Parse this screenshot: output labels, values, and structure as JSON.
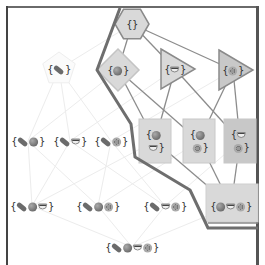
{
  "diagram": {
    "type": "hasse-lattice",
    "elements": {
      "hotdog": "🌭",
      "tomato": "🍅",
      "cup": "☕",
      "cookie": "🍪"
    },
    "nodes": [
      {
        "id": "empty",
        "label": "{}",
        "items": [],
        "shape": "hexagon",
        "highlighted": true,
        "x": 132,
        "y": 24
      },
      {
        "id": "h",
        "label": "{🌭}",
        "items": [
          "hotdog"
        ],
        "shape": "pentagon",
        "highlighted": false,
        "x": 59,
        "y": 69
      },
      {
        "id": "t",
        "label": "{🍅}",
        "items": [
          "tomato"
        ],
        "shape": "diamond",
        "highlighted": true,
        "x": 118,
        "y": 70
      },
      {
        "id": "c",
        "label": "{☕}",
        "items": [
          "cup"
        ],
        "shape": "triangle",
        "highlighted": true,
        "x": 175,
        "y": 69
      },
      {
        "id": "k",
        "label": "{🍪}",
        "items": [
          "cookie"
        ],
        "shape": "triangle",
        "highlighted": true,
        "x": 233,
        "y": 70
      },
      {
        "id": "ht",
        "label": "{🌭🍅}",
        "items": [
          "hotdog",
          "tomato"
        ],
        "shape": "none",
        "highlighted": false,
        "x": 28,
        "y": 141
      },
      {
        "id": "hc",
        "label": "{🌭☕}",
        "items": [
          "hotdog",
          "cup"
        ],
        "shape": "none",
        "highlighted": false,
        "x": 70,
        "y": 141
      },
      {
        "id": "hk",
        "label": "{🌭🍪}",
        "items": [
          "hotdog",
          "cookie"
        ],
        "shape": "none",
        "highlighted": false,
        "x": 111,
        "y": 141
      },
      {
        "id": "tc",
        "label": "{🍅☕}",
        "items": [
          "tomato",
          "cup"
        ],
        "shape": "square",
        "highlighted": true,
        "x": 155,
        "y": 141
      },
      {
        "id": "tk",
        "label": "{🍅🍪}",
        "items": [
          "tomato",
          "cookie"
        ],
        "shape": "square",
        "highlighted": true,
        "x": 199,
        "y": 141
      },
      {
        "id": "ck",
        "label": "{☕🍪}",
        "items": [
          "cup",
          "cookie"
        ],
        "shape": "square",
        "highlighted": true,
        "x": 240,
        "y": 141
      },
      {
        "id": "htc",
        "label": "{🌭🍅☕}",
        "items": [
          "hotdog",
          "tomato",
          "cup"
        ],
        "shape": "none",
        "highlighted": false,
        "x": 32,
        "y": 206
      },
      {
        "id": "htk",
        "label": "{🌭🍅🍪}",
        "items": [
          "hotdog",
          "tomato",
          "cookie"
        ],
        "shape": "none",
        "highlighted": false,
        "x": 98,
        "y": 206
      },
      {
        "id": "hck",
        "label": "{🌭☕🍪}",
        "items": [
          "hotdog",
          "cup",
          "cookie"
        ],
        "shape": "none",
        "highlighted": false,
        "x": 165,
        "y": 206
      },
      {
        "id": "tck",
        "label": "{🍅☕🍪}",
        "items": [
          "tomato",
          "cup",
          "cookie"
        ],
        "shape": "rectangle",
        "highlighted": true,
        "x": 231,
        "y": 206
      },
      {
        "id": "htck",
        "label": "{🌭🍅☕🍪}",
        "items": [
          "hotdog",
          "tomato",
          "cup",
          "cookie"
        ],
        "shape": "none",
        "highlighted": false,
        "x": 132,
        "y": 247
      }
    ],
    "highlighted_edges": [
      [
        "empty",
        "t"
      ],
      [
        "empty",
        "c"
      ],
      [
        "empty",
        "k"
      ],
      [
        "t",
        "tc"
      ],
      [
        "t",
        "tk"
      ],
      [
        "c",
        "tc"
      ],
      [
        "c",
        "ck"
      ],
      [
        "k",
        "tk"
      ],
      [
        "k",
        "ck"
      ],
      [
        "tc",
        "tck"
      ],
      [
        "tk",
        "tck"
      ],
      [
        "ck",
        "tck"
      ]
    ],
    "faint_edges": [
      [
        "empty",
        "h"
      ],
      [
        "h",
        "ht"
      ],
      [
        "h",
        "hc"
      ],
      [
        "h",
        "hk"
      ],
      [
        "t",
        "ht"
      ],
      [
        "c",
        "hc"
      ],
      [
        "k",
        "hk"
      ],
      [
        "ht",
        "htc"
      ],
      [
        "ht",
        "htk"
      ],
      [
        "hc",
        "htc"
      ],
      [
        "hc",
        "hck"
      ],
      [
        "hk",
        "htk"
      ],
      [
        "hk",
        "hck"
      ],
      [
        "tc",
        "htc"
      ],
      [
        "tk",
        "htk"
      ],
      [
        "ck",
        "hck"
      ],
      [
        "htc",
        "htck"
      ],
      [
        "htk",
        "htck"
      ],
      [
        "hck",
        "htck"
      ],
      [
        "tck",
        "htck"
      ]
    ],
    "boundary_path": [
      [
        120,
        8
      ],
      [
        97,
        70
      ],
      [
        131,
        124
      ],
      [
        135,
        157
      ],
      [
        190,
        190
      ],
      [
        208,
        228
      ],
      [
        258,
        228
      ]
    ],
    "colors": {
      "node_fill": "#d9d9d9",
      "node_fill_dark": "#c8c8c8",
      "node_stroke": "#8a8a8a",
      "highlight_edge": "#8c8c8c",
      "faint_edge": "#ececec",
      "boundary": "#6e6e6e",
      "frame": "#555555"
    }
  }
}
